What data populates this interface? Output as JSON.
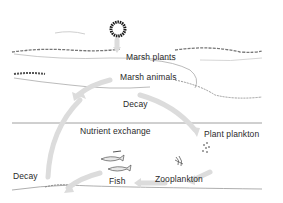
{
  "diagram": {
    "labels": {
      "marsh_plants": "Marsh plants",
      "marsh_animals": "Marsh animals",
      "decay_upper": "Decay",
      "nutrient_exchange": "Nutrient exchange",
      "plant_plankton": "Plant plankton",
      "zooplankton": "Zooplankton",
      "fish": "Fish",
      "decay_lower": "Decay"
    },
    "colors": {
      "arrow": "#d9d9d9",
      "ink": "#2a2a2a",
      "sun": "#1a1a1a"
    }
  }
}
